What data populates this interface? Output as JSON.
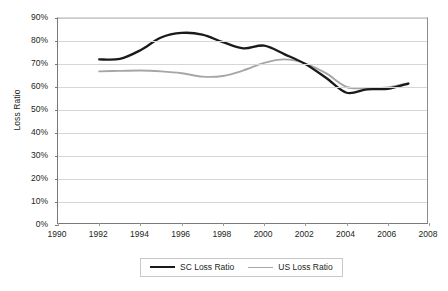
{
  "chart_data": {
    "type": "line",
    "title": "",
    "xlabel": "",
    "ylabel": "Loss Ratio",
    "xlim": [
      1990,
      2008
    ],
    "ylim": [
      0,
      0.9
    ],
    "grid": true,
    "legend_position": "bottom",
    "y_tick_labels": [
      "90%",
      "80%",
      "70%",
      "60%",
      "50%",
      "40%",
      "30%",
      "20%",
      "10%",
      "0%"
    ],
    "y_tick_values": [
      0.9,
      0.8,
      0.7,
      0.6,
      0.5,
      0.4,
      0.3,
      0.2,
      0.1,
      0.0
    ],
    "x_tick_labels": [
      "1990",
      "1992",
      "1994",
      "1996",
      "1998",
      "2000",
      "2002",
      "2004",
      "2006",
      "2008"
    ],
    "x_tick_values": [
      1990,
      1992,
      1994,
      1996,
      1998,
      2000,
      2002,
      2004,
      2006,
      2008
    ],
    "x": [
      1992,
      1993,
      1994,
      1995,
      1996,
      1997,
      1998,
      1999,
      2000,
      2001,
      2002,
      2003,
      2004,
      2005,
      2006,
      2007
    ],
    "series": [
      {
        "name": "SC Loss Ratio",
        "color": "#1a1a1a",
        "values": [
          0.72,
          0.722,
          0.76,
          0.815,
          0.835,
          0.828,
          0.795,
          0.768,
          0.78,
          0.742,
          0.7,
          0.64,
          0.575,
          0.59,
          0.592,
          0.615
        ]
      },
      {
        "name": "US Loss Ratio",
        "color": "#a6a6a6",
        "values": [
          0.668,
          0.67,
          0.672,
          0.668,
          0.66,
          0.645,
          0.648,
          0.672,
          0.705,
          0.72,
          0.702,
          0.66,
          0.6,
          0.595,
          0.598,
          0.617
        ]
      }
    ]
  },
  "legend": {
    "items": [
      {
        "label": "SC Loss Ratio",
        "swatch": "line-swatch-black"
      },
      {
        "label": "US Loss Ratio",
        "swatch": "line-swatch-gray"
      }
    ]
  }
}
